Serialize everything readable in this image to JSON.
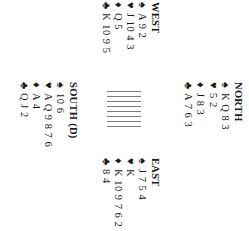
{
  "hands": {
    "west": {
      "title": "WEST",
      "spades": "A 9 2",
      "hearts": "J 10 4 3",
      "diamonds": "Q 5",
      "clubs": "K 10 9 5"
    },
    "north": {
      "title": "NORTH",
      "spades": "K Q 8 3",
      "hearts": "5 2",
      "diamonds": "J 8 3",
      "clubs": "A 7 6 3"
    },
    "east": {
      "title": "EAST",
      "spades": "J 7 5 4",
      "hearts": "K",
      "diamonds": "K 10 9 7 6 2",
      "clubs": "8 4"
    },
    "south": {
      "title": "SOUTH (D)",
      "spades": "10 6",
      "hearts": "A Q 9 8 7 6",
      "diamonds": "A 4",
      "clubs": "Q J 2"
    }
  },
  "suits": {
    "spades": "♠",
    "hearts": "♥",
    "diamonds": "♦",
    "clubs": "♣"
  },
  "table": {
    "bar_count": 8,
    "bar_color": "#7a7a7a"
  },
  "orientation": {
    "rotation_degrees": 90
  }
}
